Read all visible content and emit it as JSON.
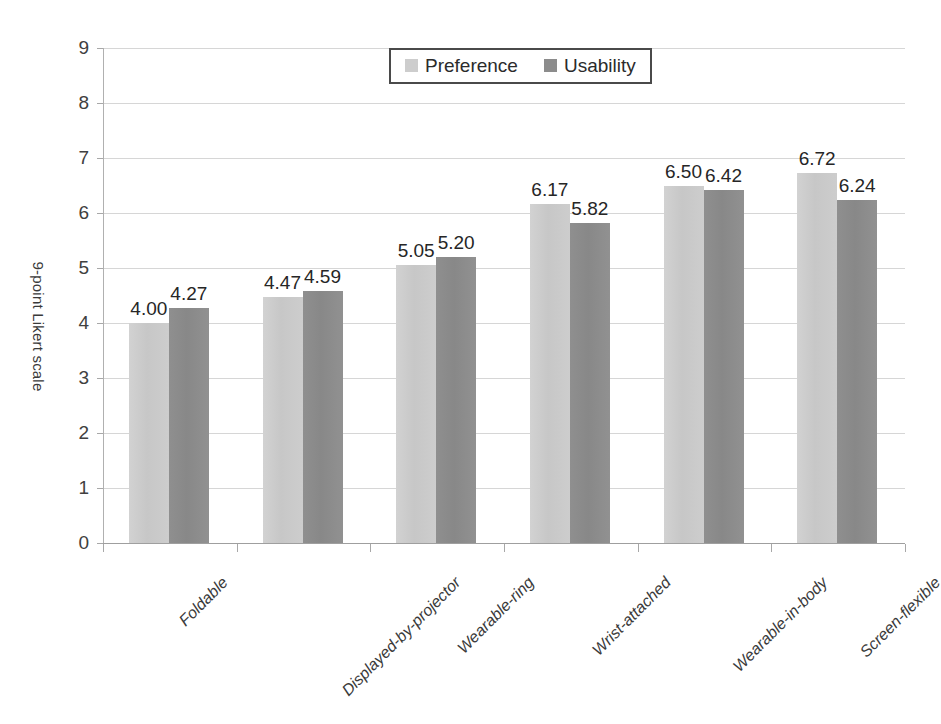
{
  "chart_data": {
    "type": "bar",
    "title": "",
    "subtitle": "",
    "xlabel": "",
    "ylabel": "9-point Likert scale",
    "ylim": [
      0,
      9
    ],
    "ytick_step": 1,
    "yticks": [
      "9",
      "8",
      "7",
      "6",
      "5",
      "4",
      "3",
      "2",
      "1",
      "0"
    ],
    "grid": true,
    "legend_position": "top-center",
    "categories": [
      "Foldable",
      "Displayed-by-projector",
      "Wearable-ring",
      "Wrist-attached",
      "Wearable-in-body",
      "Screen-flexible"
    ],
    "series": [
      {
        "name": "Preference",
        "color": "#cdcdcd",
        "values": [
          4.0,
          4.47,
          5.05,
          6.17,
          6.5,
          6.72
        ],
        "labels": [
          "4.00",
          "4.47",
          "5.05",
          "6.17",
          "6.50",
          "6.72"
        ]
      },
      {
        "name": "Usability",
        "color": "#8c8c8c",
        "values": [
          4.27,
          4.59,
          5.2,
          5.82,
          6.42,
          6.24
        ],
        "labels": [
          "4.27",
          "4.59",
          "5.20",
          "5.82",
          "6.42",
          "6.24"
        ]
      }
    ]
  },
  "legend": {
    "entries": [
      {
        "label": "Preference",
        "swatch": "preference"
      },
      {
        "label": "Usability",
        "swatch": "usability"
      }
    ]
  },
  "axis": {
    "y_title": "9-point Likert scale"
  }
}
